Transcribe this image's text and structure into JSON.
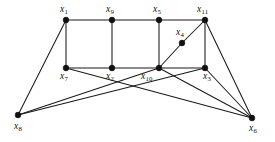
{
  "figure": {
    "type": "undirected-graph-diagram",
    "background_color": "#ffffff",
    "edge_color": "#1a1a1a",
    "vertex_color": "#111111",
    "vertex_count": 11,
    "edge_count": 19
  },
  "vertices": [
    {
      "id": "x1",
      "name": "x",
      "index": "1",
      "cx": 66,
      "cy": 20,
      "label_x": 60,
      "label_y": 5,
      "label_align": "left"
    },
    {
      "id": "x9",
      "name": "x",
      "index": "9",
      "cx": 112,
      "cy": 20,
      "label_x": 106,
      "label_y": 5,
      "label_align": "left"
    },
    {
      "id": "x5",
      "name": "x",
      "index": "5",
      "cx": 159,
      "cy": 20,
      "label_x": 153,
      "label_y": 5,
      "label_align": "left"
    },
    {
      "id": "x11",
      "name": "x",
      "index": "11",
      "cx": 205,
      "cy": 20,
      "label_x": 197,
      "label_y": 5,
      "label_align": "left"
    },
    {
      "id": "x4",
      "name": "x",
      "index": "4",
      "cx": 182,
      "cy": 43,
      "label_x": 176,
      "label_y": 28,
      "label_align": "left"
    },
    {
      "id": "x7",
      "name": "x",
      "index": "7",
      "cx": 66,
      "cy": 68,
      "label_x": 60,
      "label_y": 72,
      "label_align": "left"
    },
    {
      "id": "x2",
      "name": "x",
      "index": "2",
      "cx": 112,
      "cy": 68,
      "label_x": 106,
      "label_y": 72,
      "label_align": "left"
    },
    {
      "id": "x10",
      "name": "x",
      "index": "10",
      "cx": 159,
      "cy": 68,
      "label_x": 141,
      "label_y": 72,
      "label_align": "left"
    },
    {
      "id": "x3",
      "name": "x",
      "index": "3",
      "cx": 205,
      "cy": 68,
      "label_x": 203,
      "label_y": 72,
      "label_align": "left"
    },
    {
      "id": "x8",
      "name": "x",
      "index": "8",
      "cx": 18,
      "cy": 115,
      "label_x": 14,
      "label_y": 122,
      "label_align": "left"
    },
    {
      "id": "x6",
      "name": "x",
      "index": "6",
      "cx": 252,
      "cy": 118,
      "label_x": 249,
      "label_y": 124,
      "label_align": "left"
    }
  ],
  "edges": [
    {
      "from": "x1",
      "to": "x9"
    },
    {
      "from": "x9",
      "to": "x5"
    },
    {
      "from": "x5",
      "to": "x11"
    },
    {
      "from": "x7",
      "to": "x2"
    },
    {
      "from": "x2",
      "to": "x10"
    },
    {
      "from": "x10",
      "to": "x3"
    },
    {
      "from": "x1",
      "to": "x7"
    },
    {
      "from": "x9",
      "to": "x2"
    },
    {
      "from": "x5",
      "to": "x10"
    },
    {
      "from": "x11",
      "to": "x3"
    },
    {
      "from": "x10",
      "to": "x4"
    },
    {
      "from": "x4",
      "to": "x11"
    },
    {
      "from": "x1",
      "to": "x8"
    },
    {
      "from": "x7",
      "to": "x6"
    },
    {
      "from": "x8",
      "to": "x3"
    },
    {
      "from": "x10",
      "to": "x6"
    },
    {
      "from": "x3",
      "to": "x6"
    },
    {
      "from": "x11",
      "to": "x6"
    },
    {
      "from": "x8",
      "to": "x10"
    }
  ]
}
